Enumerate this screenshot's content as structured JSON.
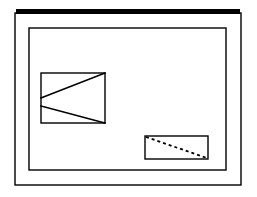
{
  "figure": {
    "title": "Nested frame line diagram with inscribed shapes",
    "canvas": {
      "width": 257,
      "height": 197,
      "background_color": "#ffffff"
    },
    "stroke_color": "#000000",
    "accent_color": "#000000",
    "elements": [
      {
        "id": "header-bar",
        "name": "header-bar",
        "shape": "filled-rectangle",
        "x": 16,
        "y": 9,
        "width": 224,
        "height": 5,
        "fill": "#000000",
        "stroke_width": 0
      },
      {
        "id": "outer-frame",
        "name": "outer-frame",
        "shape": "rectangle",
        "x": 15,
        "y": 13,
        "width": 226,
        "height": 172,
        "fill": "none",
        "stroke_width": 1.4
      },
      {
        "id": "inner-frame",
        "name": "inner-frame",
        "shape": "rectangle",
        "x": 29,
        "y": 28,
        "width": 197,
        "height": 142,
        "fill": "none",
        "stroke_width": 1.4
      },
      {
        "id": "left-rectangle",
        "name": "left-rectangle",
        "shape": "rectangle",
        "x": 41,
        "y": 73,
        "width": 64,
        "height": 50,
        "fill": "none",
        "stroke_width": 1.4
      },
      {
        "id": "left-upper-diagonal",
        "name": "left-upper-diagonal",
        "shape": "line",
        "x1": 105,
        "y1": 73,
        "x2": 41,
        "y2": 98,
        "style": "solid",
        "stroke_width": 1.6
      },
      {
        "id": "left-lower-diagonal",
        "name": "left-lower-diagonal",
        "shape": "line",
        "x1": 41,
        "y1": 106,
        "x2": 105,
        "y2": 123,
        "style": "solid",
        "stroke_width": 1.6
      },
      {
        "id": "right-rectangle",
        "name": "right-rectangle",
        "shape": "rectangle",
        "x": 145,
        "y": 136,
        "width": 63,
        "height": 23,
        "fill": "none",
        "stroke_width": 1.4
      },
      {
        "id": "right-dashed-diagonal",
        "name": "right-dashed-diagonal",
        "shape": "line",
        "x1": 146,
        "y1": 137,
        "x2": 207,
        "y2": 158,
        "style": "dashed",
        "dash_pattern": "3 3",
        "stroke_width": 1.8
      }
    ]
  }
}
